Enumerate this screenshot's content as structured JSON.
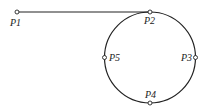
{
  "diagram": {
    "colors": {
      "stroke": "#222222",
      "background": "#ffffff"
    },
    "points": [
      {
        "id": "P1",
        "label": "P1",
        "x": 17,
        "y": 12
      },
      {
        "id": "P2",
        "label": "P2",
        "x": 150,
        "y": 12
      },
      {
        "id": "P3",
        "label": "P3",
        "x": 194,
        "y": 57
      },
      {
        "id": "P4",
        "label": "P4",
        "x": 150,
        "y": 103
      },
      {
        "id": "P5",
        "label": "P5",
        "x": 105,
        "y": 57
      }
    ],
    "labels": {
      "p1": "P1",
      "p2": "P2",
      "p3": "P3",
      "p4": "P4",
      "p5": "P5"
    },
    "segments": [
      {
        "type": "line",
        "from": "P1",
        "to": "P2"
      },
      {
        "type": "circle",
        "center": [
          150,
          57.5
        ],
        "radius": 45,
        "through": [
          "P2",
          "P3",
          "P4",
          "P5"
        ]
      }
    ]
  }
}
